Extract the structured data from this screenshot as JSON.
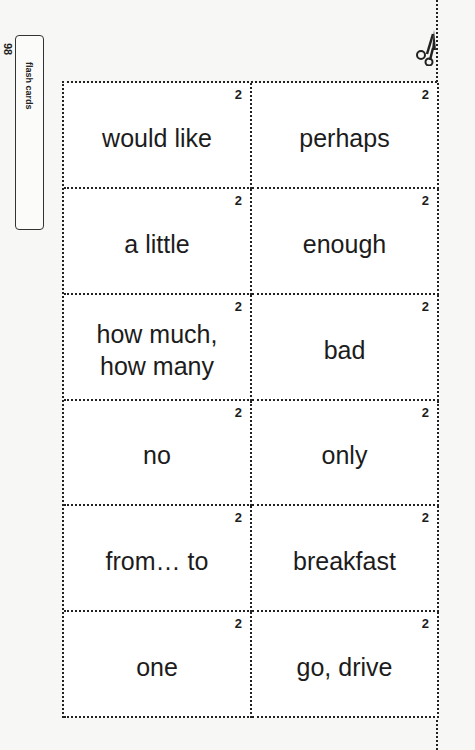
{
  "side_tab": {
    "page_number": "98",
    "label": "flash cards"
  },
  "cut_icon": "scissors-icon",
  "cards": [
    {
      "number": "2",
      "text": "would like"
    },
    {
      "number": "2",
      "text": "perhaps"
    },
    {
      "number": "2",
      "text": "a little"
    },
    {
      "number": "2",
      "text": "enough"
    },
    {
      "number": "2",
      "text": "how much, how many"
    },
    {
      "number": "2",
      "text": "bad"
    },
    {
      "number": "2",
      "text": "no"
    },
    {
      "number": "2",
      "text": "only"
    },
    {
      "number": "2",
      "text": "from… to"
    },
    {
      "number": "2",
      "text": "breakfast"
    },
    {
      "number": "2",
      "text": "one"
    },
    {
      "number": "2",
      "text": "go, drive"
    }
  ]
}
